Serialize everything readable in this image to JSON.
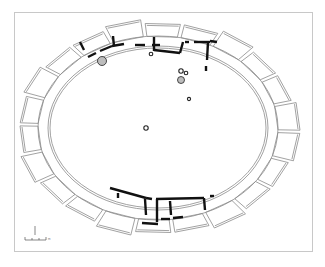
{
  "figure": {
    "type": "architectural-plan",
    "frame": {
      "x": 14,
      "y": 12,
      "width": 299,
      "height": 240,
      "stroke": "#c8c8c8"
    },
    "colors": {
      "outline": "#8a8a8a",
      "wall_fill": "#111111",
      "feature_fill": "#bdbdbd",
      "background": "#ffffff"
    },
    "enclosure": {
      "center": [
        158,
        128
      ],
      "inner_rx": 108,
      "inner_ry": 80,
      "outer_rx": 120,
      "outer_ry": 92,
      "cell_outer_rx": 138,
      "cell_outer_ry": 105,
      "cell_count": 22
    },
    "features": [
      {
        "name": "pit-large-northwest",
        "cx": 102,
        "cy": 61,
        "r": 4.5,
        "fill": true
      },
      {
        "name": "post-hole-north",
        "cx": 151,
        "cy": 54,
        "r": 1.8,
        "fill": false
      },
      {
        "name": "pit-cluster-a",
        "cx": 181,
        "cy": 71,
        "r": 2.2,
        "fill": false
      },
      {
        "name": "pit-cluster-b",
        "cx": 186,
        "cy": 73,
        "r": 1.8,
        "fill": false
      },
      {
        "name": "pit-cluster-c",
        "cx": 181,
        "cy": 80,
        "r": 3.5,
        "fill": true
      },
      {
        "name": "post-hole-east",
        "cx": 189,
        "cy": 99,
        "r": 1.6,
        "fill": false
      },
      {
        "name": "post-hole-center",
        "cx": 146,
        "cy": 128,
        "r": 2.2,
        "fill": false
      }
    ],
    "scale_bar": {
      "x": 25,
      "y": 239,
      "width": 22,
      "north_arrow": {
        "x": 35,
        "y": 227
      },
      "label": "m"
    }
  }
}
